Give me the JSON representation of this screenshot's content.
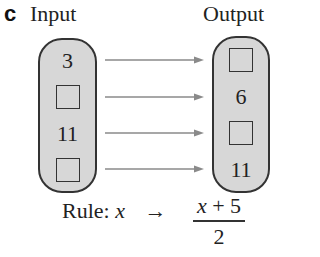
{
  "part_label": "c",
  "input_header": "Input",
  "output_header": "Output",
  "input_values": [
    "3",
    "",
    "11",
    ""
  ],
  "output_values": [
    "",
    "6",
    "",
    "11"
  ],
  "input_blank": [
    false,
    true,
    false,
    true
  ],
  "output_blank": [
    true,
    false,
    true,
    false
  ],
  "rule": {
    "prefix": "Rule: ",
    "variable": "x",
    "arrow": "→",
    "numerator": "x + 5",
    "denominator": "2"
  },
  "colors": {
    "pill_fill": "#d7d7d7",
    "outline": "#333333",
    "arrow": "#8a8a8a"
  }
}
